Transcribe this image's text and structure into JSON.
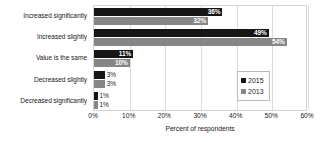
{
  "chart_data": {
    "type": "bar",
    "orientation": "horizontal",
    "title": "",
    "xlabel": "Percent of respondents",
    "ylabel": "",
    "xlim": [
      0,
      60
    ],
    "xticks": [
      "0%",
      "10%",
      "20%",
      "30%",
      "40%",
      "50%",
      "60%"
    ],
    "xtick_values": [
      0,
      10,
      20,
      30,
      40,
      50,
      60
    ],
    "grid": true,
    "grid_axis": "x",
    "legend_position": "right-inside",
    "categories": [
      "Increased significantly",
      "Increased slightly",
      "Value is the same",
      "Decreased slightly",
      "Decreased significantly"
    ],
    "series": [
      {
        "name": "2015",
        "color": "#161616",
        "values": [
          36,
          49,
          11,
          3,
          1
        ],
        "labels": [
          "36%",
          "49%",
          "11%",
          "3%",
          "1%"
        ],
        "label_placement": [
          "inside",
          "inside",
          "inside",
          "outside",
          "outside"
        ]
      },
      {
        "name": "2013",
        "color": "#868686",
        "values": [
          32,
          54,
          10,
          3,
          1
        ],
        "labels": [
          "32%",
          "54%",
          "10%",
          "3%",
          "1%"
        ],
        "label_placement": [
          "inside",
          "inside",
          "inside",
          "outside",
          "outside"
        ]
      }
    ]
  },
  "legend": {
    "entries": [
      {
        "label": "2015",
        "color": "#161616",
        "swatch_icon": "square-marker-icon"
      },
      {
        "label": "2013",
        "color": "#868686",
        "swatch_icon": "square-marker-icon"
      }
    ]
  }
}
